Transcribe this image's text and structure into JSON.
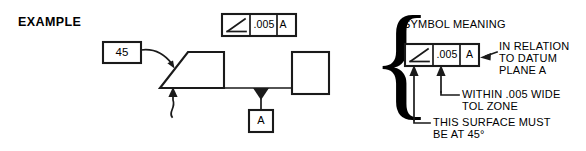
{
  "figure": {
    "title": "EXAMPLE",
    "background_color": "#ffffff",
    "line_color": "#1a1a1a"
  },
  "example_diagram": {
    "angle_callout": {
      "value": "45",
      "leader": "curved-arrow-to-angled-surface"
    },
    "feature_control_frame": {
      "symbol_name": "angularity-symbol",
      "tolerance": ".005",
      "datum": "A"
    },
    "datum_feature_symbol": {
      "label": "A",
      "triangle": "filled"
    },
    "part_shapes": [
      {
        "name": "trapezoid-part",
        "description": "angled-surface-trapezoid"
      },
      {
        "name": "rectangle-part",
        "description": "plain-rectangle"
      }
    ],
    "surface_leader": "arrow-pointing-up-at-bottom-surface"
  },
  "symbol_meaning": {
    "heading": "SYMBOL MEANING",
    "feature_control_frame": {
      "symbol_name": "angularity-symbol",
      "tolerance": ".005",
      "datum": "A"
    },
    "annotations": [
      {
        "id": "datum-note",
        "lines": [
          "IN RELATION",
          "TO DATUM",
          "PLANE A"
        ],
        "points_to": "datum-cell"
      },
      {
        "id": "tolerance-note",
        "lines": [
          "WITHIN .005 WIDE",
          "TOL ZONE"
        ],
        "points_to": "tolerance-cell"
      },
      {
        "id": "surface-note",
        "lines": [
          "THIS SURFACE MUST",
          "BE AT 45°"
        ],
        "points_to": "symbol-cell"
      }
    ],
    "brace": "{"
  }
}
